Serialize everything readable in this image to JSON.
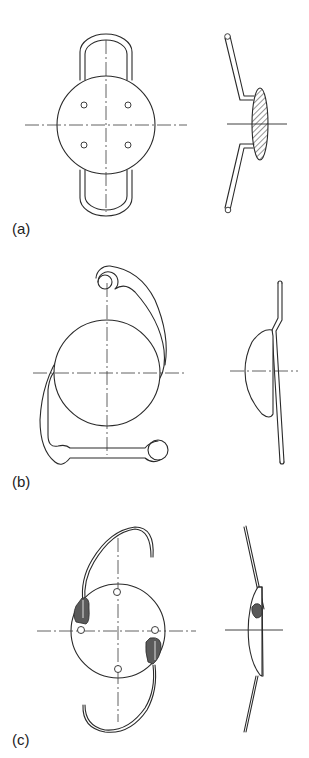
{
  "figure": {
    "panels": [
      {
        "id": "a",
        "label": "(a)",
        "front_view": "Circular optic with four positioning holes and two closed loop haptics (top and bottom)",
        "side_view": "Hatched biconvex optic with angled haptics"
      },
      {
        "id": "b",
        "label": "(b)",
        "front_view": "Circular optic with open-loop J-shaped haptics ending in eyelets",
        "side_view": "Plano-convex optic with angled haptic"
      },
      {
        "id": "c",
        "label": "(c)",
        "front_view": "Circular optic with four positioning holes, two C-shaped haptics and shaded fixation points",
        "side_view": "Plano-convex optic with angled haptics and shaded fixation"
      }
    ],
    "colors": {
      "line": "#2a2a2a",
      "fill_shaded": "#555555",
      "background": "#ffffff"
    }
  }
}
